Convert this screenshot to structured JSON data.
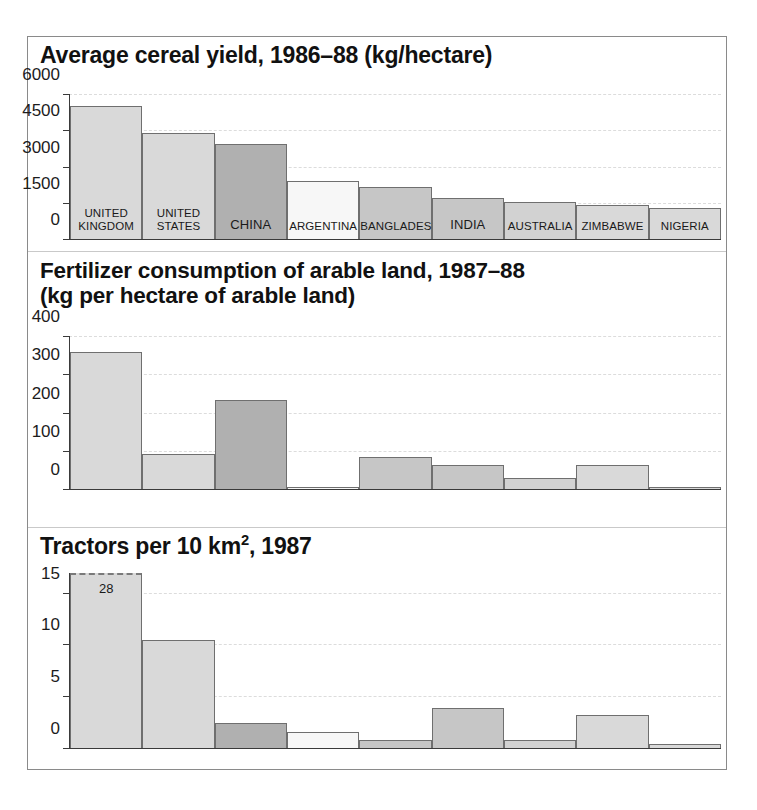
{
  "figure": {
    "panels": [
      {
        "id": "cereal-yield",
        "title": "Average cereal yield, 1986–88 (kg/hectare)"
      },
      {
        "id": "fertilizer",
        "title_line1": "Fertilizer consumption of arable land, 1987–88",
        "title_line2": "(kg per hectare of arable land)"
      },
      {
        "id": "tractors",
        "title_prefix": "Tractors per 10 km",
        "title_sup": "2",
        "title_suffix": ", 1987"
      }
    ]
  },
  "chart_data": [
    {
      "type": "bar",
      "title": "Average cereal yield, 1986–88 (kg/hectare)",
      "xlabel": "",
      "ylabel": "kg/hectare",
      "ylim": [
        0,
        6000
      ],
      "yticks": [
        "0",
        "1500",
        "3000",
        "4500",
        "6000"
      ],
      "ytick_values": [
        0,
        1500,
        3000,
        4500,
        6000
      ],
      "grid": true,
      "legend": "none",
      "categories": [
        "UNITED KINGDOM",
        "UNITED STATES",
        "CHINA",
        "ARGENTINA",
        "BANGLADESH",
        "INDIA",
        "AUSTRALIA",
        "ZIMBABWE",
        "NIGERIA"
      ],
      "bar_labels": [
        "UNITED\nKINGDOM",
        "UNITED\nSTATES",
        "CHINA",
        "ARGENTINA",
        "BANGLADESH",
        "INDIA",
        "AUSTRALIA",
        "ZIMBABWE",
        "NIGERIA"
      ],
      "values": [
        5550,
        4400,
        3950,
        2400,
        2150,
        1700,
        1550,
        1420,
        1280
      ],
      "colors": [
        "#d9d9d9",
        "#d9d9d9",
        "#b0b0b0",
        "#f7f7f7",
        "#c6c6c6",
        "#c6c6c6",
        "#d2d2d2",
        "#d9d9d9",
        "#d9d9d9"
      ]
    },
    {
      "type": "bar",
      "title": "Fertilizer consumption of arable land, 1987–88 (kg per hectare of arable land)",
      "xlabel": "",
      "ylabel": "kg per hectare of arable land",
      "ylim": [
        0,
        400
      ],
      "yticks": [
        "0",
        "100",
        "200",
        "300",
        "400"
      ],
      "ytick_values": [
        0,
        100,
        200,
        300,
        400
      ],
      "grid": true,
      "legend": "none",
      "categories": [
        "UNITED KINGDOM",
        "UNITED STATES",
        "CHINA",
        "ARGENTINA",
        "BANGLADESH",
        "INDIA",
        "AUSTRALIA",
        "ZIMBABWE",
        "NIGERIA"
      ],
      "values": [
        360,
        93,
        234,
        5,
        84,
        64,
        29,
        64,
        6
      ],
      "colors": [
        "#d9d9d9",
        "#d9d9d9",
        "#b0b0b0",
        "#f7f7f7",
        "#c6c6c6",
        "#c6c6c6",
        "#d2d2d2",
        "#d9d9d9",
        "#d9d9d9"
      ]
    },
    {
      "type": "bar",
      "title": "Tractors per 10 km2, 1987",
      "xlabel": "",
      "ylabel": "tractors per 10 km2",
      "ylim": [
        0,
        17
      ],
      "yticks": [
        "0",
        "5",
        "10",
        "15"
      ],
      "ytick_values": [
        0,
        5,
        10,
        15
      ],
      "grid": true,
      "legend": "none",
      "categories": [
        "UNITED KINGDOM",
        "UNITED STATES",
        "CHINA",
        "ARGENTINA",
        "BANGLADESH",
        "INDIA",
        "AUSTRALIA",
        "ZIMBABWE",
        "NIGERIA"
      ],
      "values": [
        28,
        10.5,
        2.4,
        1.6,
        0.8,
        3.9,
        0.8,
        3.2,
        0.4
      ],
      "value_labels": [
        "28",
        "",
        "",
        "",
        "",
        "",
        "",
        "",
        ""
      ],
      "clipped": [
        true,
        false,
        false,
        false,
        false,
        false,
        false,
        false,
        false
      ],
      "colors": [
        "#d9d9d9",
        "#d9d9d9",
        "#b0b0b0",
        "#f7f7f7",
        "#c6c6c6",
        "#c6c6c6",
        "#d2d2d2",
        "#d9d9d9",
        "#d9d9d9"
      ]
    }
  ]
}
